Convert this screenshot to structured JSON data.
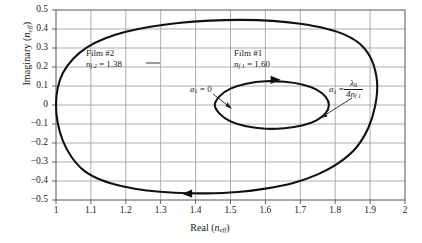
{
  "chart_data": {
    "type": "line",
    "title": "",
    "xlabel": "Real (n_eff)",
    "ylabel": "Imaginary (n_eff)",
    "xlim": [
      1,
      2
    ],
    "ylim": [
      -0.5,
      0.5
    ],
    "grid": true,
    "legend_position": "none",
    "xticks": [
      "1",
      "1.1",
      "1.2",
      "1.3",
      "1.4",
      "1.5",
      "1.6",
      "1.7",
      "1.8",
      "1.9",
      "2"
    ],
    "xtick_values": [
      1,
      1.1,
      1.2,
      1.3,
      1.4,
      1.5,
      1.6,
      1.7,
      1.8,
      1.9,
      2
    ],
    "yticks": [
      "0.5",
      "0.4",
      "0.3",
      "0.2",
      "0.1",
      "0",
      "-0.1",
      "-0.2",
      "-0.3",
      "-0.4",
      "-0.5"
    ],
    "ytick_values": [
      0.5,
      0.4,
      0.3,
      0.2,
      0.1,
      0,
      -0.1,
      -0.2,
      -0.3,
      -0.4,
      -0.5
    ],
    "series": [
      {
        "name": "Film #2",
        "refractive_index": 1.38,
        "closed_loop": true,
        "x": [
          1.0,
          1.005,
          1.02,
          1.05,
          1.09,
          1.14,
          1.2,
          1.27,
          1.35,
          1.44,
          1.53,
          1.62,
          1.7,
          1.77,
          1.83,
          1.875,
          1.905,
          1.92,
          1.915,
          1.895,
          1.86,
          1.81,
          1.75,
          1.68,
          1.6,
          1.52,
          1.43,
          1.34,
          1.26,
          1.19,
          1.13,
          1.08,
          1.045,
          1.02,
          1.005,
          1.0
        ],
        "y": [
          0.0,
          0.09,
          0.17,
          0.245,
          0.305,
          0.35,
          0.385,
          0.412,
          0.432,
          0.444,
          0.448,
          0.443,
          0.428,
          0.404,
          0.368,
          0.315,
          0.235,
          0.12,
          0.0,
          -0.12,
          -0.225,
          -0.305,
          -0.365,
          -0.41,
          -0.44,
          -0.458,
          -0.465,
          -0.462,
          -0.45,
          -0.428,
          -0.395,
          -0.345,
          -0.275,
          -0.19,
          -0.095,
          0.0
        ]
      },
      {
        "name": "Film #1",
        "refractive_index": 1.6,
        "closed_loop": true,
        "x": [
          1.455,
          1.47,
          1.5,
          1.545,
          1.6,
          1.655,
          1.705,
          1.745,
          1.772,
          1.782,
          1.772,
          1.745,
          1.705,
          1.655,
          1.6,
          1.545,
          1.5,
          1.47,
          1.455
        ],
        "y": [
          0.0,
          0.048,
          0.086,
          0.112,
          0.125,
          0.122,
          0.108,
          0.082,
          0.044,
          0.0,
          -0.044,
          -0.082,
          -0.108,
          -0.122,
          -0.125,
          -0.112,
          -0.086,
          -0.048,
          0.0
        ]
      }
    ],
    "annotations": [
      {
        "name": "film2-label",
        "line1": "Film #2",
        "symbol": "n",
        "sub": "f 2",
        "eq": "= 1.38"
      },
      {
        "name": "film1-label",
        "line1": "Film #1",
        "symbol": "n",
        "sub": "f 1",
        "eq": "= 1.60"
      },
      {
        "name": "a1-zero-label",
        "symbol": "a",
        "sub": "1",
        "eq": "= 0"
      },
      {
        "name": "a1-quarter-wave-label",
        "symbol": "a",
        "sub": "1",
        "eq": "=",
        "numerator_symbol": "λ",
        "numerator_sub": "0",
        "denominator": "4n",
        "denominator_sub": "f 1"
      }
    ],
    "direction_arrows": [
      {
        "name": "outer-loop-arrow",
        "x": 1.38,
        "y": -0.455,
        "direction": "left"
      },
      {
        "name": "inner-loop-arrow",
        "x": 1.625,
        "y": 0.124,
        "direction": "right"
      }
    ]
  },
  "axes": {
    "ylabel_prefix": "Imaginary (",
    "ylabel_symbol": "n",
    "ylabel_sub": "eff",
    "ylabel_suffix": ")",
    "xlabel_prefix": "Real (",
    "xlabel_symbol": "n",
    "xlabel_sub": "eff",
    "xlabel_suffix": ")"
  },
  "style": {
    "curve_color": "#111111",
    "grid_color": "#9a9a9a",
    "frame_color": "#555555",
    "background": "#ffffff"
  }
}
